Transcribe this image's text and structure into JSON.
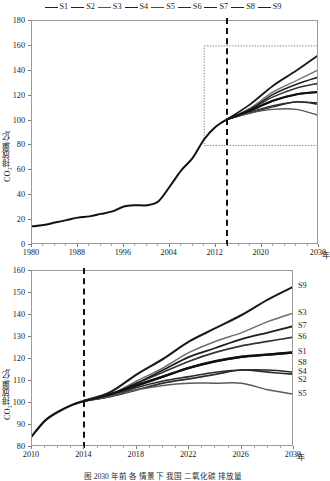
{
  "legend": {
    "items": [
      {
        "label": "S1",
        "color": "#1f1f1f"
      },
      {
        "label": "S2",
        "color": "#1f1f1f"
      },
      {
        "label": "S3",
        "color": "#555555"
      },
      {
        "label": "S4",
        "color": "#1f1f1f"
      },
      {
        "label": "S5",
        "color": "#4a4a4a"
      },
      {
        "label": "S6",
        "color": "#2a2a2a"
      },
      {
        "label": "S7",
        "color": "#1f1f1f"
      },
      {
        "label": "S8",
        "color": "#1f1f1f"
      },
      {
        "label": "S9",
        "color": "#1f1f1f"
      }
    ]
  },
  "caption": {
    "text": "图  2030 年前 各 情景 下 我国 二氧化碳 排放量"
  },
  "chart_data": [
    {
      "id": "top",
      "type": "line",
      "title": "",
      "xlabel": "年",
      "ylabel": "CO₂排放量/亿t",
      "xlim": [
        1980,
        2030
      ],
      "ylim": [
        0,
        180
      ],
      "xticks": [
        1980,
        1988,
        1996,
        2004,
        2012,
        2020,
        2030
      ],
      "xticklabels": [
        "1980",
        "1988",
        "1996",
        "2004",
        "2012",
        "2020",
        "2030"
      ],
      "yticks": [
        0,
        20,
        40,
        60,
        80,
        100,
        120,
        140,
        160,
        180
      ],
      "grid": false,
      "legend_position": "top-center",
      "annotations": [
        {
          "type": "vline",
          "x": 2014,
          "style": "dashed",
          "label": "base year 2014"
        },
        {
          "type": "rect",
          "x0": 2010,
          "x1": 2030,
          "y0": 80,
          "y1": 160,
          "style": "dotted",
          "label": "zoom region shown in lower panel"
        }
      ],
      "history": {
        "name": "historical",
        "x": [
          1980,
          1982,
          1984,
          1986,
          1988,
          1990,
          1992,
          1994,
          1996,
          1998,
          2000,
          2002,
          2004,
          2006,
          2008,
          2010,
          2012,
          2014
        ],
        "y": [
          15,
          16,
          18,
          20,
          22,
          23,
          25,
          27,
          31,
          32,
          32,
          35,
          47,
          60,
          70,
          85,
          95,
          101
        ]
      },
      "series": [
        {
          "name": "S1",
          "x": [
            2014,
            2018,
            2022,
            2026,
            2030
          ],
          "y": [
            101,
            108,
            116,
            121,
            123
          ]
        },
        {
          "name": "S2",
          "x": [
            2014,
            2018,
            2022,
            2026,
            2030
          ],
          "y": [
            101,
            106,
            111,
            115,
            113
          ]
        },
        {
          "name": "S3",
          "x": [
            2014,
            2018,
            2022,
            2026,
            2030
          ],
          "y": [
            101,
            110,
            123,
            132,
            141
          ]
        },
        {
          "name": "S4",
          "x": [
            2014,
            2018,
            2022,
            2026,
            2030
          ],
          "y": [
            101,
            107,
            112,
            115,
            114
          ]
        },
        {
          "name": "S5",
          "x": [
            2014,
            2018,
            2022,
            2026,
            2030
          ],
          "y": [
            101,
            106,
            109,
            109,
            104
          ]
        },
        {
          "name": "S6",
          "x": [
            2014,
            2018,
            2022,
            2026,
            2030
          ],
          "y": [
            101,
            109,
            119,
            126,
            130
          ]
        },
        {
          "name": "S7",
          "x": [
            2014,
            2018,
            2022,
            2026,
            2030
          ],
          "y": [
            101,
            109,
            121,
            129,
            135
          ]
        },
        {
          "name": "S8",
          "x": [
            2014,
            2018,
            2022,
            2026,
            2030
          ],
          "y": [
            101,
            108,
            116,
            121,
            123
          ]
        },
        {
          "name": "S9",
          "x": [
            2014,
            2018,
            2022,
            2026,
            2030
          ],
          "y": [
            101,
            113,
            128,
            140,
            153
          ]
        }
      ]
    },
    {
      "id": "bottom",
      "type": "line",
      "title": "",
      "xlabel": "年",
      "ylabel": "CO₂排放量/亿t",
      "xlim": [
        2010,
        2030
      ],
      "ylim": [
        80,
        160
      ],
      "xticks": [
        2010,
        2014,
        2018,
        2022,
        2026,
        2030
      ],
      "xticklabels": [
        "2010",
        "2014",
        "2018",
        "2022",
        "2026",
        "2030"
      ],
      "yticks": [
        80,
        90,
        100,
        110,
        120,
        130,
        140,
        150,
        160
      ],
      "grid": false,
      "legend_position": "right-of-axes",
      "annotations": [
        {
          "type": "vline",
          "x": 2014,
          "style": "dashed",
          "label": "base year 2014"
        }
      ],
      "history": {
        "name": "historical",
        "x": [
          2010,
          2011,
          2012,
          2013,
          2014
        ],
        "y": [
          85,
          92,
          96,
          99,
          101
        ]
      },
      "series": [
        {
          "name": "S1",
          "x": [
            2014,
            2016,
            2018,
            2020,
            2022,
            2024,
            2026,
            2028,
            2030
          ],
          "y": [
            101,
            104,
            108,
            112,
            116,
            119,
            121,
            122,
            123
          ]
        },
        {
          "name": "S2",
          "x": [
            2014,
            2016,
            2018,
            2020,
            2022,
            2024,
            2026,
            2028,
            2030
          ],
          "y": [
            101,
            103,
            106,
            109,
            111,
            113,
            115,
            114,
            113
          ]
        },
        {
          "name": "S3",
          "x": [
            2014,
            2016,
            2018,
            2020,
            2022,
            2024,
            2026,
            2028,
            2030
          ],
          "y": [
            101,
            104,
            110,
            116,
            123,
            128,
            132,
            137,
            141
          ]
        },
        {
          "name": "S4",
          "x": [
            2014,
            2016,
            2018,
            2020,
            2022,
            2024,
            2026,
            2028,
            2030
          ],
          "y": [
            101,
            103,
            107,
            110,
            112,
            114,
            115,
            115,
            114
          ]
        },
        {
          "name": "S5",
          "x": [
            2014,
            2016,
            2018,
            2020,
            2022,
            2024,
            2026,
            2028,
            2030
          ],
          "y": [
            101,
            103,
            106,
            108,
            109,
            109,
            109,
            106,
            104
          ]
        },
        {
          "name": "S6",
          "x": [
            2014,
            2016,
            2018,
            2020,
            2022,
            2024,
            2026,
            2028,
            2030
          ],
          "y": [
            101,
            104,
            109,
            114,
            119,
            123,
            126,
            128,
            130
          ]
        },
        {
          "name": "S7",
          "x": [
            2014,
            2016,
            2018,
            2020,
            2022,
            2024,
            2026,
            2028,
            2030
          ],
          "y": [
            101,
            104,
            109,
            115,
            121,
            125,
            129,
            132,
            135
          ]
        },
        {
          "name": "S8",
          "x": [
            2014,
            2016,
            2018,
            2020,
            2022,
            2024,
            2026,
            2028,
            2030
          ],
          "y": [
            101,
            104,
            108,
            112,
            116,
            119,
            121,
            122,
            123
          ]
        },
        {
          "name": "S9",
          "x": [
            2014,
            2016,
            2018,
            2020,
            2022,
            2024,
            2026,
            2028,
            2030
          ],
          "y": [
            101,
            105,
            113,
            120,
            128,
            134,
            140,
            147,
            153
          ]
        }
      ],
      "end_labels": [
        {
          "name": "S9",
          "value": 153
        },
        {
          "name": "S3",
          "value": 141
        },
        {
          "name": "S7",
          "value": 135
        },
        {
          "name": "S6",
          "value": 130
        },
        {
          "name": "S1",
          "value": 123
        },
        {
          "name": "S8",
          "value": 123
        },
        {
          "name": "S4",
          "value": 114
        },
        {
          "name": "S2",
          "value": 113
        },
        {
          "name": "S5",
          "value": 104
        }
      ]
    }
  ]
}
